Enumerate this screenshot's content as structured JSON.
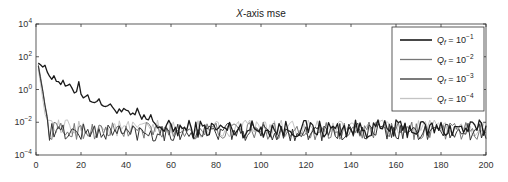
{
  "chart_data": {
    "type": "line",
    "title": "X-axis mse",
    "title_italic_part": "X",
    "title_rest": "-axis mse",
    "xlabel": "",
    "ylabel": "",
    "xlim": [
      0,
      200
    ],
    "ylim": [
      0.0001,
      10000
    ],
    "yscale": "log",
    "grid": false,
    "legend_position": "upper right",
    "x_ticks": [
      0,
      20,
      40,
      60,
      80,
      100,
      120,
      140,
      160,
      180,
      200
    ],
    "y_ticks": [
      {
        "value": 0.0001,
        "base": "10",
        "exp": "−4"
      },
      {
        "value": 0.01,
        "base": "10",
        "exp": "−2"
      },
      {
        "value": 1,
        "base": "10",
        "exp": "0"
      },
      {
        "value": 100,
        "base": "10",
        "exp": "2"
      },
      {
        "value": 10000,
        "base": "10",
        "exp": "4"
      }
    ],
    "series": [
      {
        "name": "Q_f = 10^-1",
        "label_base": "Q",
        "label_sub": "f",
        "label_exp": "−1",
        "color": "#1a1a1a",
        "width": 1.3,
        "profile": "slow",
        "start": 300,
        "decay_to": 0.008,
        "decay_len": 55,
        "noise_level": 0.004
      },
      {
        "name": "Q_f = 10^-2",
        "label_base": "Q",
        "label_sub": "f",
        "label_exp": "−2",
        "color": "#777777",
        "width": 1.0,
        "profile": "fast",
        "start": 250,
        "decay_to": 0.003,
        "decay_len": 6,
        "noise_level": 0.003
      },
      {
        "name": "Q_f = 10^-3",
        "label_base": "Q",
        "label_sub": "f",
        "label_exp": "−3",
        "color": "#333333",
        "width": 1.0,
        "profile": "fast",
        "start": 200,
        "decay_to": 0.002,
        "decay_len": 6,
        "noise_level": 0.0025
      },
      {
        "name": "Q_f = 10^-4",
        "label_base": "Q",
        "label_sub": "f",
        "label_exp": "−4",
        "color": "#c4c4c4",
        "width": 1.0,
        "profile": "fast",
        "start": 150,
        "decay_to": 0.005,
        "decay_len": 5,
        "noise_level": 0.004
      }
    ],
    "annotations": [
      {
        "series": 0,
        "x": 19,
        "y": 1.5,
        "note": "spike on Q_f=10^-1 curve near x≈19"
      }
    ]
  }
}
